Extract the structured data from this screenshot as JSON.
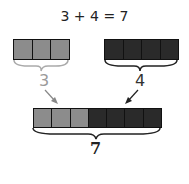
{
  "equation": "3 + 4 = 7",
  "groups": [
    {
      "count": 3,
      "label": "3",
      "color": "#8c8c8c"
    },
    {
      "count": 4,
      "label": "4",
      "color": "#2a2a2a"
    }
  ],
  "total": {
    "count": 7,
    "label": "7"
  },
  "colors": {
    "light": "#8c8c8c",
    "dark": "#2a2a2a",
    "light_label": "#9a9a9a",
    "dark_label": "#333333"
  }
}
